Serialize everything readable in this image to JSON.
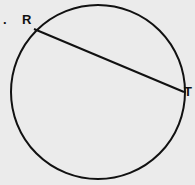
{
  "figure": {
    "number_label": ".",
    "points": [
      {
        "name": "R",
        "x": 34,
        "y": 29
      },
      {
        "name": "T",
        "x": 184,
        "y": 92
      }
    ],
    "circle": {
      "cx": 98,
      "cy": 92,
      "r": 87
    },
    "chord": "RT",
    "stroke_color": "#111111",
    "background_color": "#ebebeb"
  }
}
